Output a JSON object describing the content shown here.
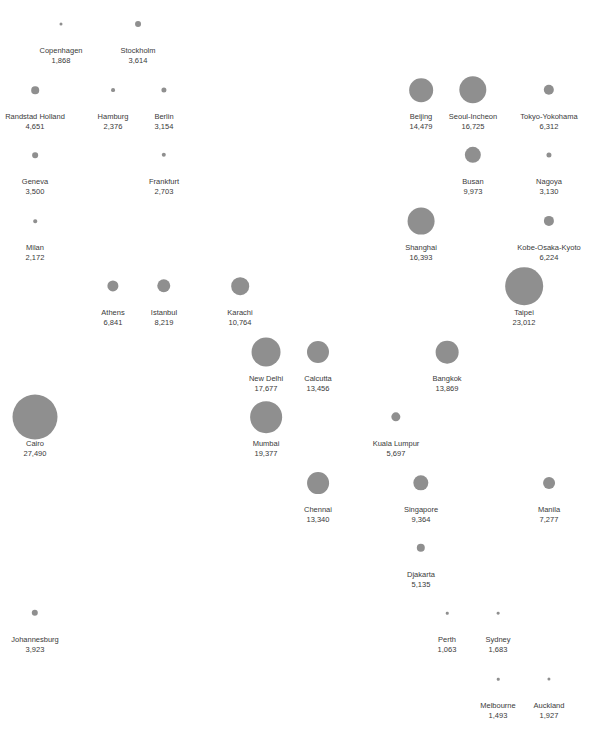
{
  "chart": {
    "dot_color": "#8f8f8f",
    "text_color": "#3a3a3a",
    "diameter_per_unit": 0.001637
  },
  "chart_data": {
    "type": "scatter",
    "title": "",
    "xlabel": "",
    "ylabel": "",
    "grid": false,
    "legend": "none",
    "encoding": "proportional circle (diameter ~ value)",
    "points": [
      {
        "name": "Copenhagen",
        "value": 1868,
        "value_label": "1,868",
        "x": 61,
        "y": 24
      },
      {
        "name": "Stockholm",
        "value": 3614,
        "value_label": "3,614",
        "x": 138,
        "y": 24
      },
      {
        "name": "Randstad Holland",
        "value": 4651,
        "value_label": "4,651",
        "x": 35,
        "y": 90
      },
      {
        "name": "Hamburg",
        "value": 2376,
        "value_label": "2,376",
        "x": 113,
        "y": 90
      },
      {
        "name": "Berlin",
        "value": 3154,
        "value_label": "3,154",
        "x": 164,
        "y": 90
      },
      {
        "name": "Beijing",
        "value": 14479,
        "value_label": "14,479",
        "x": 421,
        "y": 90
      },
      {
        "name": "Seoul-Incheon",
        "value": 16725,
        "value_label": "16,725",
        "x": 473,
        "y": 90
      },
      {
        "name": "Tokyo-Yokohama",
        "value": 6312,
        "value_label": "6,312",
        "x": 549,
        "y": 90
      },
      {
        "name": "Geneva",
        "value": 3500,
        "value_label": "3,500",
        "x": 35,
        "y": 155
      },
      {
        "name": "Frankfurt",
        "value": 2703,
        "value_label": "2,703",
        "x": 164,
        "y": 155
      },
      {
        "name": "Busan",
        "value": 9973,
        "value_label": "9,973",
        "x": 473,
        "y": 155
      },
      {
        "name": "Nagoya",
        "value": 3130,
        "value_label": "3,130",
        "x": 549,
        "y": 155
      },
      {
        "name": "Milan",
        "value": 2172,
        "value_label": "2,172",
        "x": 35,
        "y": 221
      },
      {
        "name": "Shanghai",
        "value": 16393,
        "value_label": "16,393",
        "x": 421,
        "y": 221
      },
      {
        "name": "Kobe-Osaka-Kyoto",
        "value": 6224,
        "value_label": "6,224",
        "x": 549,
        "y": 221
      },
      {
        "name": "Athens",
        "value": 6841,
        "value_label": "6,841",
        "x": 113,
        "y": 286
      },
      {
        "name": "Istanbul",
        "value": 8219,
        "value_label": "8,219",
        "x": 164,
        "y": 286
      },
      {
        "name": "Karachi",
        "value": 10764,
        "value_label": "10,764",
        "x": 240,
        "y": 286
      },
      {
        "name": "Taipei",
        "value": 23012,
        "value_label": "23,012",
        "x": 524,
        "y": 286
      },
      {
        "name": "New Delhi",
        "value": 17677,
        "value_label": "17,677",
        "x": 266,
        "y": 352
      },
      {
        "name": "Calcutta",
        "value": 13456,
        "value_label": "13,456",
        "x": 318,
        "y": 352
      },
      {
        "name": "Bangkok",
        "value": 13869,
        "value_label": "13,869",
        "x": 447,
        "y": 352
      },
      {
        "name": "Cairo",
        "value": 27490,
        "value_label": "27,490",
        "x": 35,
        "y": 417
      },
      {
        "name": "Mumbai",
        "value": 19377,
        "value_label": "19,377",
        "x": 266,
        "y": 417
      },
      {
        "name": "Kuala Lumpur",
        "value": 5697,
        "value_label": "5,697",
        "x": 396,
        "y": 417
      },
      {
        "name": "Chennai",
        "value": 13340,
        "value_label": "13,340",
        "x": 318,
        "y": 483
      },
      {
        "name": "Singapore",
        "value": 9364,
        "value_label": "9,364",
        "x": 421,
        "y": 483
      },
      {
        "name": "Manila",
        "value": 7277,
        "value_label": "7,277",
        "x": 549,
        "y": 483
      },
      {
        "name": "Djakarta",
        "value": 5135,
        "value_label": "5,135",
        "x": 421,
        "y": 548
      },
      {
        "name": "Johannesburg",
        "value": 3923,
        "value_label": "3,923",
        "x": 35,
        "y": 613
      },
      {
        "name": "Perth",
        "value": 1063,
        "value_label": "1,063",
        "x": 447,
        "y": 613
      },
      {
        "name": "Sydney",
        "value": 1683,
        "value_label": "1,683",
        "x": 498,
        "y": 613
      },
      {
        "name": "Melbourne",
        "value": 1493,
        "value_label": "1,493",
        "x": 498,
        "y": 679
      },
      {
        "name": "Auckland",
        "value": 1927,
        "value_label": "1,927",
        "x": 549,
        "y": 679
      }
    ]
  }
}
